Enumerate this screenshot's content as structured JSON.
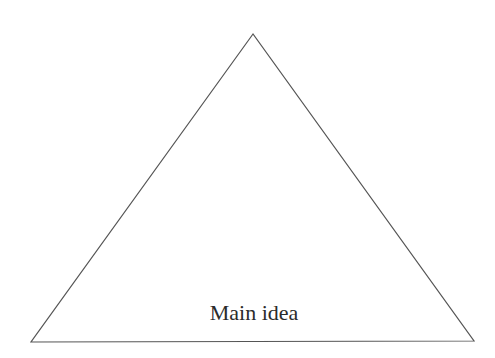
{
  "diagram": {
    "type": "pyramid-triangle",
    "label": "Main idea",
    "stroke_color": "#555555",
    "fill_color": "#ffffff",
    "text_color": "#2b2b2b"
  }
}
